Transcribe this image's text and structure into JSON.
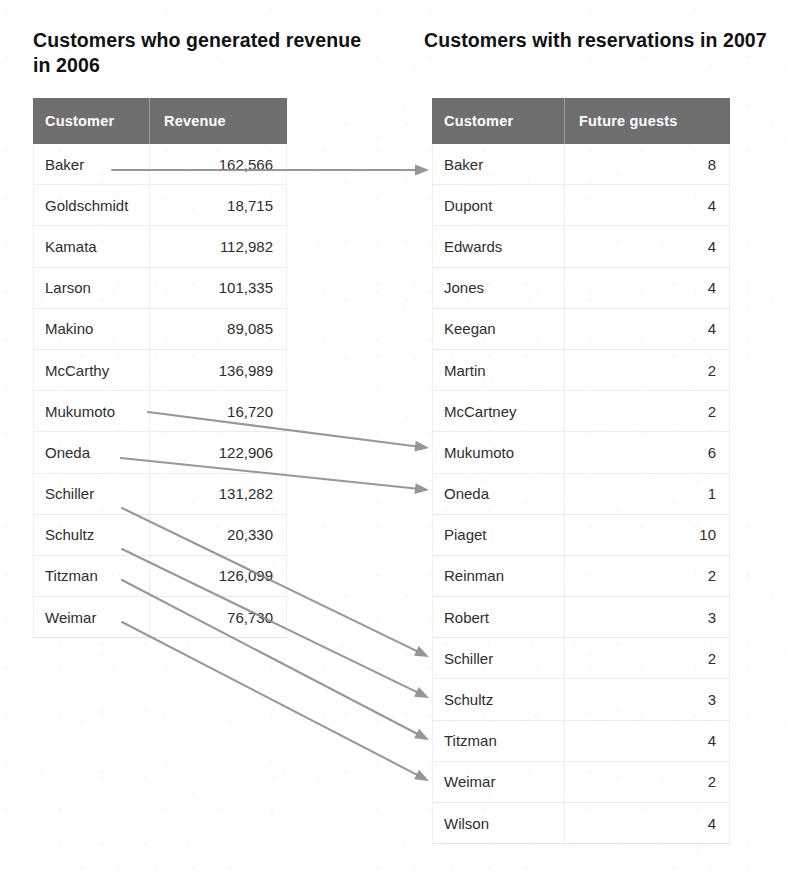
{
  "left_panel": {
    "heading": "Customers who generated revenue in 2006",
    "columns": {
      "name": "Customer",
      "value": "Revenue"
    },
    "rows": [
      {
        "name": "Baker",
        "value": "162,566"
      },
      {
        "name": "Goldschmidt",
        "value": "18,715"
      },
      {
        "name": "Kamata",
        "value": "112,982"
      },
      {
        "name": "Larson",
        "value": "101,335"
      },
      {
        "name": "Makino",
        "value": "89,085"
      },
      {
        "name": "McCarthy",
        "value": "136,989"
      },
      {
        "name": "Mukumoto",
        "value": "16,720"
      },
      {
        "name": "Oneda",
        "value": "122,906"
      },
      {
        "name": "Schiller",
        "value": "131,282"
      },
      {
        "name": "Schultz",
        "value": "20,330"
      },
      {
        "name": "Titzman",
        "value": "126,099"
      },
      {
        "name": "Weimar",
        "value": "76,730"
      }
    ]
  },
  "right_panel": {
    "heading": "Customers with reservations in 2007",
    "columns": {
      "name": "Customer",
      "value": "Future guests"
    },
    "rows": [
      {
        "name": "Baker",
        "value": "8"
      },
      {
        "name": "Dupont",
        "value": "4"
      },
      {
        "name": "Edwards",
        "value": "4"
      },
      {
        "name": "Jones",
        "value": "4"
      },
      {
        "name": "Keegan",
        "value": "4"
      },
      {
        "name": "Martin",
        "value": "2"
      },
      {
        "name": "McCartney",
        "value": "2"
      },
      {
        "name": "Mukumoto",
        "value": "6"
      },
      {
        "name": "Oneda",
        "value": "1"
      },
      {
        "name": "Piaget",
        "value": "10"
      },
      {
        "name": "Reinman",
        "value": "2"
      },
      {
        "name": "Robert",
        "value": "3"
      },
      {
        "name": "Schiller",
        "value": "2"
      },
      {
        "name": "Schultz",
        "value": "3"
      },
      {
        "name": "Titzman",
        "value": "4"
      },
      {
        "name": "Weimar",
        "value": "2"
      },
      {
        "name": "Wilson",
        "value": "4"
      }
    ]
  },
  "links": [
    {
      "from": "Baker",
      "to": "Baker",
      "x1": 112,
      "y1": 170,
      "x2": 429,
      "y2": 170
    },
    {
      "from": "Mukumoto",
      "to": "Mukumoto",
      "x1": 148,
      "y1": 412,
      "x2": 429,
      "y2": 448
    },
    {
      "from": "Oneda",
      "to": "Oneda",
      "x1": 121,
      "y1": 458,
      "x2": 429,
      "y2": 490
    },
    {
      "from": "Schiller",
      "to": "Schiller",
      "x1": 122,
      "y1": 508,
      "x2": 429,
      "y2": 657
    },
    {
      "from": "Schultz",
      "to": "Schultz",
      "x1": 122,
      "y1": 549,
      "x2": 429,
      "y2": 698
    },
    {
      "from": "Titzman",
      "to": "Titzman",
      "x1": 122,
      "y1": 580,
      "x2": 429,
      "y2": 740
    },
    {
      "from": "Weimar",
      "to": "Weimar",
      "x1": 122,
      "y1": 622,
      "x2": 429,
      "y2": 781
    }
  ],
  "colors": {
    "header_background": "#6f6f6f",
    "header_text": "#ffffff",
    "body_text": "#2e2e2e",
    "arrow": "#8a8a8a",
    "row_separator": "#ececec",
    "page_background": "#ffffff"
  }
}
